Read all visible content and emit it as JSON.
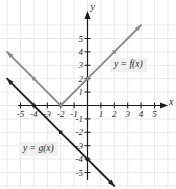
{
  "figure": {
    "background_color": "#ffffff",
    "grid_color": "#e8e8e8",
    "axis_color": "#1a1a1a",
    "width": 176,
    "height": 189
  },
  "axes": {
    "x_name": "x",
    "y_name": "y",
    "x_ticks": [
      "-5",
      "-4",
      "-3",
      "-2",
      "-1",
      "1",
      "2",
      "3",
      "4",
      "5"
    ],
    "y_ticks": [
      "5",
      "4",
      "3",
      "2",
      "1",
      "-1",
      "-2",
      "-3",
      "-4",
      "-5"
    ]
  },
  "annotations": {
    "f_label": "y = f(x)",
    "g_label": "y = g(x)"
  },
  "chart_data": {
    "type": "line",
    "title": "",
    "xlabel": "x",
    "ylabel": "y",
    "xlim": [
      -6.2,
      6.2
    ],
    "ylim": [
      -6.4,
      6.4
    ],
    "grid": true,
    "legend": "inline-annotations",
    "x_ticks": [
      -5,
      -4,
      -3,
      -2,
      -1,
      1,
      2,
      3,
      4,
      5
    ],
    "y_ticks": [
      5,
      4,
      3,
      2,
      1,
      -1,
      -2,
      -3,
      -4,
      -5
    ],
    "series": [
      {
        "name": "y = f(x)",
        "equation": "y = |x + 2|",
        "color": "#8a8a8a",
        "marker": "square",
        "arrows": "both",
        "vertex": [
          -2,
          0
        ],
        "points": [
          [
            -6,
            4
          ],
          [
            -5,
            3
          ],
          [
            -4,
            2
          ],
          [
            -3,
            1
          ],
          [
            -2,
            0
          ],
          [
            -1,
            1
          ],
          [
            0,
            2
          ],
          [
            1,
            3
          ],
          [
            2,
            4
          ],
          [
            3,
            5
          ],
          [
            4,
            6
          ]
        ]
      },
      {
        "name": "y = g(x)",
        "equation": "y = -x - 4",
        "color": "#1f1f1f",
        "marker": "square",
        "arrows": "both",
        "x_intercept": -4,
        "y_intercept": -4,
        "slope": -1,
        "points": [
          [
            -6,
            2
          ],
          [
            -5,
            1
          ],
          [
            -4,
            0
          ],
          [
            -3,
            -1
          ],
          [
            -2,
            -2
          ],
          [
            -1,
            -3
          ],
          [
            0,
            -4
          ],
          [
            1,
            -5
          ],
          [
            2,
            -6
          ]
        ]
      }
    ]
  }
}
